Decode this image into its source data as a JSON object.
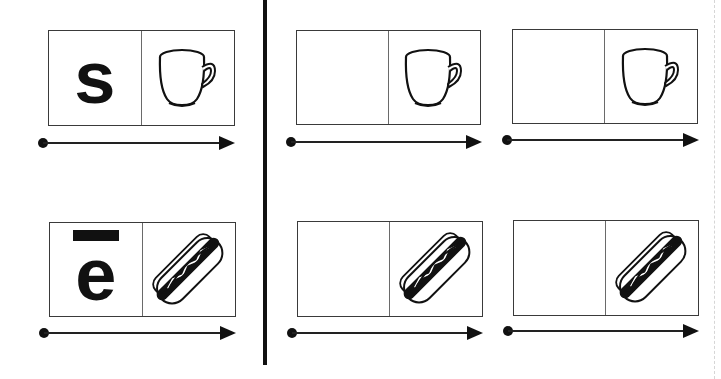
{
  "worksheet": {
    "rows": [
      {
        "name": "row-cup",
        "model": {
          "letter": "s",
          "macron": false,
          "picture": "cup-icon"
        },
        "practice": [
          {
            "letter": "",
            "picture": "cup-icon"
          },
          {
            "letter": "",
            "picture": "cup-icon"
          }
        ]
      },
      {
        "name": "row-hotdog",
        "model": {
          "letter": "e",
          "macron": true,
          "picture": "hotdog-icon"
        },
        "practice": [
          {
            "letter": "",
            "picture": "hotdog-icon"
          },
          {
            "letter": "",
            "picture": "hotdog-icon"
          }
        ]
      }
    ]
  },
  "colors": {
    "ink": "#111111",
    "border": "#3a3a3a",
    "background": "#ffffff"
  }
}
